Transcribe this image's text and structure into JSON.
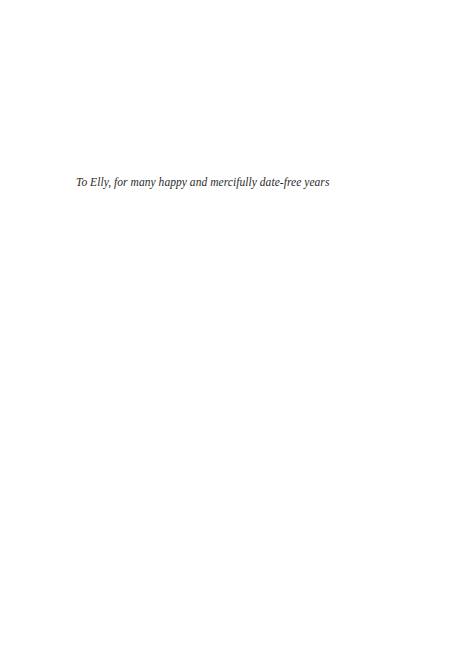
{
  "page": {
    "dedication": "To Elly, for many happy and mercifully date-free years"
  }
}
